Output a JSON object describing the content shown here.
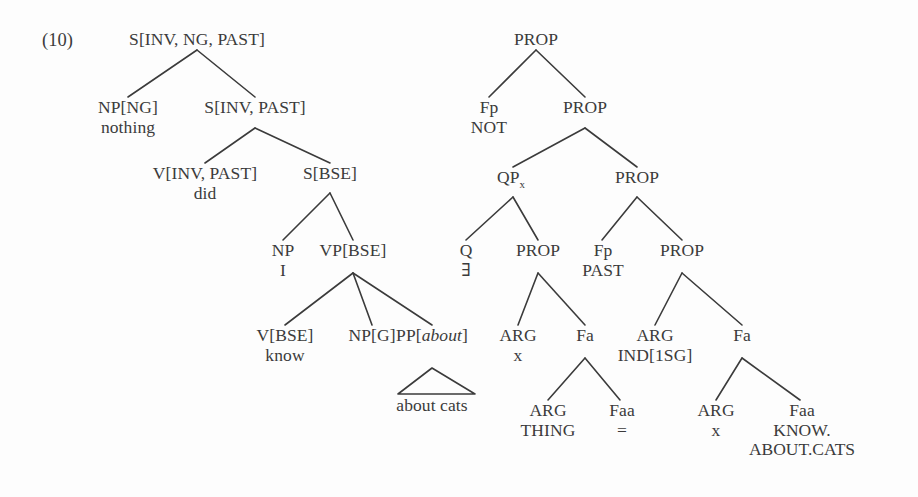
{
  "figure": {
    "example_number": "(10)",
    "text_color": "#3b3b3b",
    "line_color": "#3b3b3b",
    "background": "#fdfdfd"
  },
  "syntax_tree": {
    "name": "surface-syntax-tree",
    "nodes": {
      "root": {
        "cat": "S[INV, NG, PAST]",
        "lex": ""
      },
      "np_ng": {
        "cat": "NP[NG]",
        "lex": "nothing"
      },
      "s_inv_past": {
        "cat": "S[INV, PAST]",
        "lex": ""
      },
      "v_inv_past": {
        "cat": "V[INV, PAST]",
        "lex": "did"
      },
      "s_bse": {
        "cat": "S[BSE]",
        "lex": ""
      },
      "np": {
        "cat": "NP",
        "lex": "I"
      },
      "vp_bse": {
        "cat": "VP[BSE]",
        "lex": ""
      },
      "v_bse": {
        "cat": "V[BSE]",
        "lex": "know"
      },
      "np_g": {
        "cat": "NP[G]",
        "lex": ""
      },
      "pp_about": {
        "cat_prefix": "PP[",
        "cat_italic": "about",
        "cat_suffix": "]"
      },
      "pp_triangle_lex": "about cats"
    }
  },
  "semantic_tree": {
    "name": "semantic-representation-tree",
    "nodes": {
      "prop_root": {
        "cat": "PROP",
        "lex": ""
      },
      "fp_not": {
        "cat": "Fp",
        "lex": "NOT"
      },
      "prop_2": {
        "cat": "PROP",
        "lex": ""
      },
      "qp_x": {
        "cat_base": "QP",
        "cat_sub": "x"
      },
      "prop_3": {
        "cat": "PROP",
        "lex": ""
      },
      "q_exists": {
        "cat": "Q",
        "lex": "∃"
      },
      "prop_4": {
        "cat": "PROP",
        "lex": ""
      },
      "fp_past": {
        "cat": "Fp",
        "lex": "PAST"
      },
      "prop_5": {
        "cat": "PROP",
        "lex": ""
      },
      "arg_x": {
        "cat": "ARG",
        "lex": "x"
      },
      "fa_left": {
        "cat": "Fa",
        "lex": ""
      },
      "arg_ind": {
        "cat": "ARG",
        "lex": "IND[1SG]"
      },
      "fa_right": {
        "cat": "Fa",
        "lex": ""
      },
      "arg_thing": {
        "cat": "ARG",
        "lex": "THING"
      },
      "faa_eq": {
        "cat": "Faa",
        "lex": "="
      },
      "arg_x2": {
        "cat": "ARG",
        "lex": "x"
      },
      "faa_know": {
        "cat": "Faa",
        "lex": "KNOW.",
        "lex2": "ABOUT.CATS"
      }
    }
  }
}
